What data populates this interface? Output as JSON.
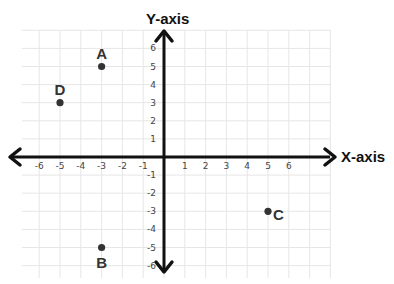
{
  "diagram": {
    "type": "coordinate-plane",
    "x_axis_label": "X-axis",
    "y_axis_label": "Y-axis",
    "x_ticks": [
      -6,
      -5,
      -4,
      -3,
      -2,
      -1,
      1,
      2,
      3,
      4,
      5,
      6
    ],
    "y_ticks": [
      6,
      5,
      4,
      3,
      2,
      1,
      -1,
      -2,
      -3,
      -4,
      -5,
      -6
    ],
    "points": [
      {
        "label": "A",
        "x": -3,
        "y": 5
      },
      {
        "label": "B",
        "x": -3,
        "y": -5
      },
      {
        "label": "C",
        "x": 5,
        "y": -3
      },
      {
        "label": "D",
        "x": -5,
        "y": 3
      }
    ],
    "colors": {
      "axis": "#111111",
      "grid": "#e6e6e6",
      "point": "#333333"
    }
  }
}
